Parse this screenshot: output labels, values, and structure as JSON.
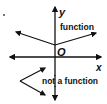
{
  "diagram": {
    "axes": {
      "x_label": "x",
      "y_label": "y",
      "origin_label": "O"
    },
    "graphs": [
      {
        "name": "function",
        "label": "function",
        "description": "V-shaped graph opening upward, vertex on y-axis above origin",
        "vertex": [
          55,
          45
        ],
        "rays": [
          [
            16,
            32
          ],
          [
            96,
            33
          ]
        ]
      },
      {
        "name": "not-a-function",
        "label": "not a function",
        "description": "V-shaped graph opening rightward, vertex left of y-axis",
        "vertex": [
          20,
          81
        ],
        "rays": [
          [
            45,
            68
          ],
          [
            45,
            95
          ]
        ]
      }
    ],
    "colors": {
      "stroke": "#111111",
      "background": "#ffffff"
    }
  }
}
